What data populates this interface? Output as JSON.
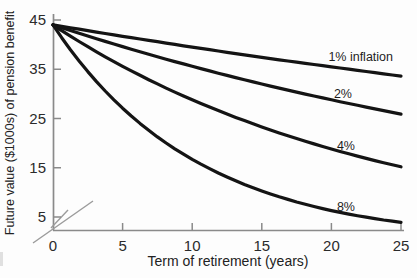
{
  "chart_data": {
    "type": "line",
    "title": "",
    "xlabel": "Term of retirement (years)",
    "ylabel": "Future value ($1000s) of pension benefit",
    "x": [
      0,
      5,
      10,
      15,
      20,
      25
    ],
    "x_ticks": [
      "0",
      "5",
      "10",
      "15",
      "20",
      "25"
    ],
    "y_ticks": [
      "45",
      "35",
      "25",
      "15",
      "5"
    ],
    "xlim": [
      0,
      25
    ],
    "ylim": [
      5,
      45
    ],
    "grid": false,
    "axis_break_at_origin": true,
    "legend_position": "inline-labels-right",
    "line_color": "#141414",
    "axis_color": "#8a8a8a",
    "series": [
      {
        "name": "1% inflation",
        "values": [
          44,
          41.7,
          39.5,
          37.4,
          35.5,
          33.6
        ]
      },
      {
        "name": "2%",
        "values": [
          44,
          39.6,
          35.6,
          32.0,
          28.8,
          25.9
        ]
      },
      {
        "name": "4%",
        "values": [
          44,
          35.6,
          28.8,
          23.3,
          18.8,
          15.2
        ]
      },
      {
        "name": "8%",
        "values": [
          44,
          27.1,
          16.7,
          10.3,
          6.3,
          3.9
        ]
      }
    ]
  }
}
